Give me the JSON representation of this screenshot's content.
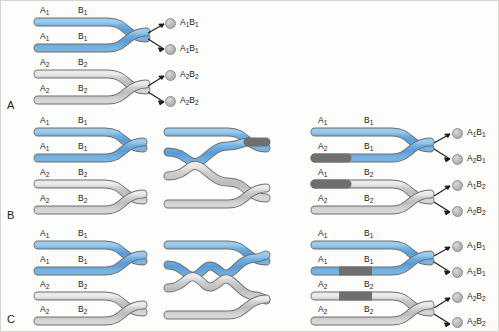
{
  "figure": {
    "colors": {
      "blue_chromatid": "#5e9fd6",
      "blue_chromatid_light": "#8fc2e8",
      "gray_chromatid": "#bcbcbc",
      "gray_chromatid_light": "#e2e2e2",
      "outline": "#6f6f6f",
      "text": "#1b1b1b",
      "gamete_fill": "#bdbdbd",
      "background": "#fdfdfb"
    },
    "alleles": {
      "a1": "A1",
      "a2": "A2",
      "b1": "B1",
      "b2": "B2"
    }
  },
  "panels": [
    {
      "id": "A",
      "label": "A",
      "name": "no-crossover",
      "columns": [
        {
          "name": "paired-homologues",
          "chromatids": [
            {
              "top_label": "A1",
              "top_label_2": "B1",
              "color": "blue"
            },
            {
              "top_label": "A1",
              "top_label_2": "B1",
              "color": "blue"
            },
            {
              "top_label": "A2",
              "top_label_2": "B2",
              "color": "gray"
            },
            {
              "top_label": "A2",
              "top_label_2": "B2",
              "color": "gray"
            }
          ]
        }
      ],
      "gametes": [
        {
          "label_a": "A1",
          "label_b": "B1"
        },
        {
          "label_a": "A1",
          "label_b": "B1"
        },
        {
          "label_a": "A2",
          "label_b": "B2"
        },
        {
          "label_a": "A2",
          "label_b": "B2"
        }
      ]
    },
    {
      "id": "B",
      "label": "B",
      "name": "single-crossover",
      "columns": [
        {
          "name": "paired-homologues",
          "chromatids": [
            {
              "top_label": "A1",
              "top_label_2": "B1",
              "color": "blue"
            },
            {
              "top_label": "A1",
              "top_label_2": "B1",
              "color": "blue"
            },
            {
              "top_label": "A2",
              "top_label_2": "B2",
              "color": "gray"
            },
            {
              "top_label": "A2",
              "top_label_2": "B2",
              "color": "gray"
            }
          ]
        },
        {
          "name": "chiasma-formation",
          "chromatids": []
        },
        {
          "name": "recombinant-chromatids",
          "chromatids": [
            {
              "top_label": "A1",
              "top_label_2": "B1",
              "color": "blue"
            },
            {
              "top_label": "A2",
              "top_label_2": "B1",
              "color": "gray-then-blue"
            },
            {
              "top_label": "A1",
              "top_label_2": "B2",
              "color": "blue-then-gray"
            },
            {
              "top_label": "A2",
              "top_label_2": "B2",
              "color": "gray"
            }
          ]
        }
      ],
      "gametes": [
        {
          "label_a": "A1",
          "label_b": "B1"
        },
        {
          "label_a": "A2",
          "label_b": "B1"
        },
        {
          "label_a": "A1",
          "label_b": "B2"
        },
        {
          "label_a": "A2",
          "label_b": "B2"
        }
      ]
    },
    {
      "id": "C",
      "label": "C",
      "name": "double-crossover",
      "columns": [
        {
          "name": "paired-homologues",
          "chromatids": [
            {
              "top_label": "A1",
              "top_label_2": "B1",
              "color": "blue"
            },
            {
              "top_label": "A1",
              "top_label_2": "B1",
              "color": "blue"
            },
            {
              "top_label": "A2",
              "top_label_2": "B2",
              "color": "gray"
            },
            {
              "top_label": "A2",
              "top_label_2": "B2",
              "color": "gray"
            }
          ]
        },
        {
          "name": "double-chiasma-formation",
          "chromatids": []
        },
        {
          "name": "recombinant-chromatids",
          "chromatids": [
            {
              "top_label": "A1",
              "top_label_2": "B1",
              "color": "blue"
            },
            {
              "top_label": "A1",
              "top_label_2": "B1",
              "color": "blue-gray-blue"
            },
            {
              "top_label": "A2",
              "top_label_2": "B2",
              "color": "gray-blue-gray"
            },
            {
              "top_label": "A2",
              "top_label_2": "B2",
              "color": "gray"
            }
          ]
        }
      ],
      "gametes": [
        {
          "label_a": "A1",
          "label_b": "B1"
        },
        {
          "label_a": "A1",
          "label_b": "B1"
        },
        {
          "label_a": "A2",
          "label_b": "B2"
        },
        {
          "label_a": "A2",
          "label_b": "B2"
        }
      ]
    }
  ]
}
